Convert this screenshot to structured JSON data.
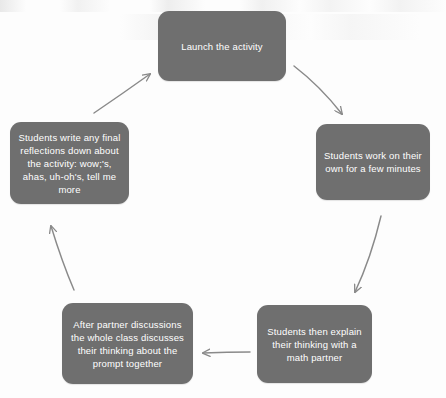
{
  "diagram": {
    "type": "cycle-flowchart",
    "title": "",
    "orientation": "clockwise",
    "background_color": "#fdfdfd",
    "node_color": "#6f6f6f",
    "node_text_color": "#ffffff",
    "arrow_color": "#8a8a8a",
    "nodes": [
      {
        "id": "launch",
        "order": 1,
        "label": "Launch the activity",
        "position": "top"
      },
      {
        "id": "own-work",
        "order": 2,
        "label": "Students work on their own for a few minutes",
        "position": "right"
      },
      {
        "id": "explain",
        "order": 3,
        "label": "Students then explain their thinking with a math partner",
        "position": "bottom-right"
      },
      {
        "id": "whole-class",
        "order": 4,
        "label": "After partner discussions the whole class discusses their thinking about the prompt together",
        "position": "bottom-left"
      },
      {
        "id": "reflect",
        "order": 5,
        "label": "Students write any final reflections down  about the activity:  wow;'s, ahas, uh-oh's, tell me more",
        "position": "left"
      }
    ],
    "edges": [
      {
        "id": "launch-to-own-work",
        "from": "launch",
        "to": "own-work",
        "style": "curved-arrow",
        "direction": "down-right"
      },
      {
        "id": "own-work-to-explain",
        "from": "own-work",
        "to": "explain",
        "style": "curved-arrow",
        "direction": "down"
      },
      {
        "id": "explain-to-whole-class",
        "from": "explain",
        "to": "whole-class",
        "style": "curved-arrow",
        "direction": "left"
      },
      {
        "id": "whole-class-to-reflect",
        "from": "whole-class",
        "to": "reflect",
        "style": "curved-arrow",
        "direction": "up"
      },
      {
        "id": "reflect-to-launch",
        "from": "reflect",
        "to": "launch",
        "style": "curved-arrow",
        "direction": "up-right"
      }
    ]
  }
}
